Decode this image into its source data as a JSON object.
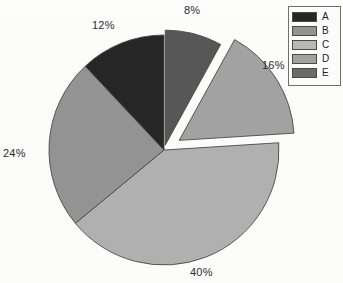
{
  "chart_data": {
    "type": "pie",
    "title": "",
    "categories": [
      "A",
      "B",
      "C",
      "D",
      "E"
    ],
    "values": [
      12,
      24,
      40,
      16,
      8
    ],
    "value_labels": [
      "12%",
      "24%",
      "40%",
      "16%",
      "8%"
    ],
    "units": "percent",
    "total": 100,
    "legend": {
      "position": "top-right",
      "entries": [
        {
          "label": "A",
          "color": "#262626",
          "value": 12,
          "value_label": "12%"
        },
        {
          "label": "B",
          "color": "#939393",
          "value": 24,
          "value_label": "24%"
        },
        {
          "label": "C",
          "color": "#b0b0b0",
          "value": 40,
          "value_label": "40%"
        },
        {
          "label": "D",
          "color": "#a2a2a2",
          "value": 16,
          "value_label": "16%"
        },
        {
          "label": "E",
          "color": "#575757",
          "value": 8,
          "value_label": "8%"
        }
      ]
    },
    "slices": [
      {
        "label": "E",
        "value": 8,
        "value_label": "8%",
        "color": "#575757",
        "start_angle": 0.0,
        "end_angle": 28.8,
        "exploded": true,
        "explode_offset": 5
      },
      {
        "label": "D",
        "value": 16,
        "value_label": "16%",
        "color": "#a2a2a2",
        "start_angle": 28.8,
        "end_angle": 86.4,
        "exploded": true,
        "explode_offset": 18
      },
      {
        "label": "C",
        "value": 40,
        "value_label": "40%",
        "color": "#b0b0b0",
        "start_angle": 86.4,
        "end_angle": 230.4,
        "exploded": false,
        "explode_offset": 0
      },
      {
        "label": "B",
        "value": 24,
        "value_label": "24%",
        "color": "#939393",
        "start_angle": 230.4,
        "end_angle": 316.8,
        "exploded": false,
        "explode_offset": 0
      },
      {
        "label": "A",
        "value": 12,
        "value_label": "12%",
        "color": "#262626",
        "start_angle": 316.8,
        "end_angle": 360.0,
        "exploded": false,
        "explode_offset": 0
      }
    ],
    "grid": false,
    "xlabel": "",
    "ylabel": ""
  },
  "labels": {
    "top": "8%",
    "right": "16%",
    "bottom": "40%",
    "left": "24%",
    "upper_left": "12%"
  },
  "legend_box": {
    "rows": [
      {
        "label": "A"
      },
      {
        "label": "B"
      },
      {
        "label": "C"
      },
      {
        "label": "D"
      },
      {
        "label": "E"
      }
    ]
  },
  "colors": {
    "slice_a": "#262626",
    "slice_b": "#939393",
    "slice_c": "#b0b0b0",
    "slice_d": "#a2a2a2",
    "slice_e": "#575757",
    "outline": "#4a4a4a",
    "background": "#fdfdfb",
    "text": "#2b2b2b"
  }
}
